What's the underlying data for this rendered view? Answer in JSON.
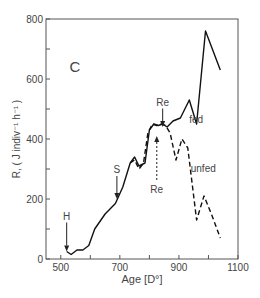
{
  "chart_data": {
    "type": "line",
    "title": "",
    "panel_label": "C",
    "xlabel": "Age [D°]",
    "ylabel": "R, ( J indiv⁻¹ h⁻¹ )",
    "xlim": [
      450,
      1100
    ],
    "ylim": [
      0,
      800
    ],
    "xticks": [
      500,
      600,
      700,
      800,
      900,
      1000,
      1100
    ],
    "xtick_labels": [
      "500",
      "",
      "700",
      "",
      "900",
      "",
      "1100"
    ],
    "yticks": [
      0,
      100,
      200,
      300,
      400,
      500,
      600,
      700,
      800
    ],
    "ytick_labels": [
      "0",
      "",
      "200",
      "",
      "400",
      "",
      "600",
      "",
      "800"
    ],
    "grid": false,
    "series": [
      {
        "name": "fed",
        "style": "solid",
        "x": [
          520,
          535,
          555,
          575,
          595,
          615,
          650,
          685,
          710,
          735,
          750,
          765,
          785,
          800,
          815,
          830,
          845,
          860,
          880,
          905,
          935,
          960,
          990,
          1040
        ],
        "y": [
          25,
          15,
          30,
          30,
          45,
          100,
          150,
          185,
          240,
          320,
          340,
          310,
          320,
          430,
          450,
          445,
          450,
          440,
          460,
          470,
          530,
          450,
          760,
          630
        ]
      },
      {
        "name": "unfed",
        "style": "dashed",
        "x": [
          735,
          750,
          765,
          780,
          795,
          810,
          825,
          840,
          855,
          870,
          890,
          910,
          930,
          960,
          985,
          1010,
          1040
        ],
        "y": [
          320,
          330,
          300,
          320,
          420,
          450,
          445,
          450,
          445,
          420,
          330,
          400,
          370,
          130,
          210,
          150,
          70
        ]
      }
    ],
    "annotations": [
      {
        "label": "H",
        "type": "arrow-down",
        "x": 520,
        "y_text": 125,
        "y_tip": 25
      },
      {
        "label": "S",
        "type": "arrow-down",
        "x": 690,
        "y_text": 280,
        "y_tip": 200
      },
      {
        "label": "Re",
        "type": "arrow-down",
        "x": 845,
        "y_text": 505,
        "y_tip": 440
      },
      {
        "label": "Re",
        "type": "arrow-up-dashed",
        "x": 825,
        "y_text": 260,
        "y_tip": 410
      },
      {
        "label": "fed",
        "type": "series-label",
        "x": 935,
        "y": 455
      },
      {
        "label": "unfed",
        "type": "series-label",
        "x": 940,
        "y": 290
      }
    ]
  }
}
